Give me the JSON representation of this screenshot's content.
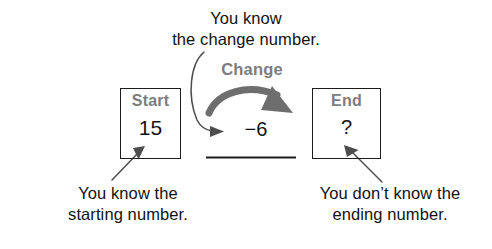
{
  "diagram": {
    "captions": {
      "change": "You know\nthe change number.",
      "start": "You know the\nstarting number.",
      "end": "You don’t know the\nending number."
    },
    "boxes": {
      "start": {
        "label": "Start",
        "value": "15"
      },
      "end": {
        "label": "End",
        "value": "?"
      }
    },
    "change": {
      "label": "Change",
      "value": "−6"
    },
    "colors": {
      "label_gray": "#7d7d7d",
      "arrow_gray": "#6e6e6e",
      "ink": "#121212",
      "background": "#ffffff"
    },
    "icons": {
      "change_arrow": "curved-arrow-right-icon",
      "pointer_to_change_value": "curved-pointer-arrow-icon",
      "pointer_to_start": "pointer-arrow-icon",
      "pointer_to_end": "pointer-arrow-icon",
      "blank_line": "answer-blank-line"
    }
  }
}
